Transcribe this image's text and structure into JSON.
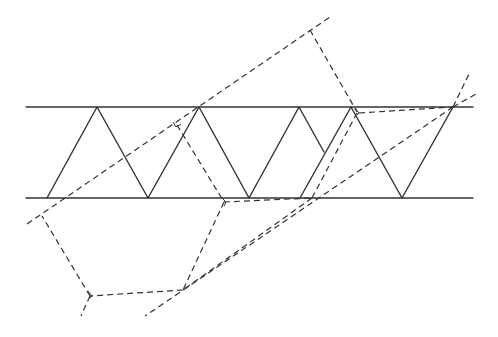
{
  "diagram": {
    "colors": {
      "stroke": "#333333",
      "background": "#ffffff"
    },
    "elements": {
      "parallel_lines": [
        "top-line",
        "bottom-line"
      ],
      "solid_zigzag": "zigzag path between parallel lines",
      "dashed_construction": "dashed construction lines (reflections / unfolding)"
    }
  }
}
